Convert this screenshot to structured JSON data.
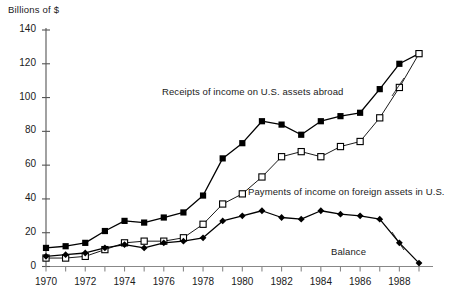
{
  "chart_data": {
    "type": "line",
    "title": "",
    "xlabel": "",
    "ylabel": "Billions of $",
    "ylim": [
      0,
      140
    ],
    "xlim": [
      1970,
      1989
    ],
    "grid": false,
    "legend_position": "inline-annotations",
    "y_ticks": [
      0,
      20,
      40,
      60,
      80,
      100,
      120,
      140
    ],
    "x_ticks": [
      1970,
      1971,
      1972,
      1973,
      1974,
      1975,
      1976,
      1977,
      1978,
      1979,
      1980,
      1981,
      1982,
      1983,
      1984,
      1985,
      1986,
      1987,
      1988,
      1989
    ],
    "x_tick_labels": [
      "1970",
      "",
      "1972",
      "",
      "1974",
      "",
      "1976",
      "",
      "1978",
      "",
      "1980",
      "",
      "1982",
      "",
      "1984",
      "",
      "1986",
      "",
      "1988",
      ""
    ],
    "x": [
      1970,
      1971,
      1972,
      1973,
      1974,
      1975,
      1976,
      1977,
      1978,
      1979,
      1980,
      1981,
      1982,
      1983,
      1984,
      1985,
      1986,
      1987,
      1988,
      1989
    ],
    "series": [
      {
        "name": "Receipts of income on U.S. assets abroad",
        "marker": "filled-square",
        "color": "#000000",
        "values": [
          11,
          12,
          14,
          21,
          27,
          26,
          29,
          32,
          42,
          64,
          73,
          86,
          84,
          78,
          86,
          89,
          91,
          105,
          120,
          126
        ]
      },
      {
        "name": "Payments of income on foreign assets in U.S.",
        "marker": "open-square",
        "color": "#000000",
        "values": [
          5,
          5,
          6,
          10,
          14,
          15,
          15,
          17,
          25,
          37,
          43,
          53,
          65,
          68,
          65,
          71,
          74,
          88,
          106,
          126
        ]
      },
      {
        "name": "Balance",
        "marker": "filled-diamond",
        "color": "#000000",
        "values": [
          6,
          7,
          8,
          11,
          13,
          11,
          14,
          15,
          17,
          27,
          30,
          33,
          29,
          28,
          33,
          31,
          30,
          28,
          14,
          2
        ]
      }
    ],
    "annotations": [
      {
        "text": "Receipts of income on U.S. assets abroad",
        "series": "Receipts of income on U.S. assets abroad"
      },
      {
        "text": "Payments of income on foreign assets in U.S.",
        "series": "Payments of income on foreign assets in U.S."
      },
      {
        "text": "Balance",
        "series": "Balance"
      }
    ]
  }
}
